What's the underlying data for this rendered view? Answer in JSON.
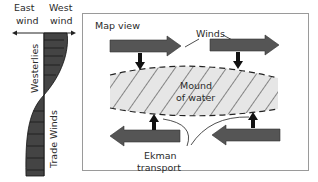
{
  "profile": {
    "east_label_1": "East",
    "east_label_2": "wind",
    "west_label_1": "West",
    "west_label_2": "wind",
    "westerlies_label": "Westerlies",
    "trade_winds_label": "Trade Winds"
  },
  "map": {
    "title": "Map view",
    "winds_label": "Winds",
    "mound_label_1": "Mound",
    "mound_label_2": "of water",
    "ekman_label_1": "Ekman",
    "ekman_label_2": "transport"
  },
  "colors": {
    "arrow_fill": "#555555",
    "small_arrow_fill": "#111111",
    "mound_fill": "#e6e6e6",
    "profile_fill": "#444444",
    "box_border": "#9a9a9a",
    "text": "#2a2a2a"
  }
}
